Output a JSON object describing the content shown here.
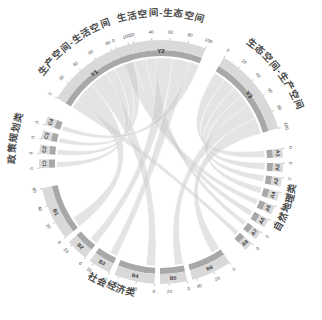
{
  "figure": {
    "type": "chord-diagram",
    "background": "#ffffff",
    "ribbon_color": "#c9c9c9",
    "arc_outer_color": "#d9d9d9",
    "arc_inner_color": "#a8a8a8"
  },
  "groups": [
    {
      "id": "Y1",
      "label": "生产空间-生活空间",
      "axis_label": "Y1",
      "position": "top-left",
      "ticks": [
        0,
        20,
        40,
        60,
        80,
        100
      ],
      "total": 100
    },
    {
      "id": "Y2",
      "label": "生活空间-生态空间",
      "axis_label": "Y2",
      "position": "top-center",
      "ticks": [
        0,
        20,
        40,
        60,
        80,
        100
      ],
      "total": 100
    },
    {
      "id": "Y3",
      "label": "生态空间-生产空间",
      "axis_label": "Y3",
      "position": "top-right",
      "ticks": [
        0,
        20,
        40,
        60,
        80,
        100
      ],
      "total": 100
    },
    {
      "id": "A",
      "label": "自然地理类",
      "position": "right",
      "segments": [
        {
          "id": "A1",
          "ticks": [
            0
          ],
          "value": 10
        },
        {
          "id": "A2",
          "ticks": [
            0
          ],
          "value": 10
        },
        {
          "id": "A3",
          "ticks": [
            0
          ],
          "value": 10
        },
        {
          "id": "A4",
          "ticks": [
            0
          ],
          "value": 10
        },
        {
          "id": "A5",
          "ticks": [
            0
          ],
          "value": 10
        },
        {
          "id": "A6",
          "ticks": [
            0
          ],
          "value": 10
        },
        {
          "id": "A7",
          "ticks": [
            0
          ],
          "value": 10
        },
        {
          "id": "A8",
          "ticks": [
            0
          ],
          "value": 10
        }
      ]
    },
    {
      "id": "C",
      "label": "政策规划类",
      "position": "left",
      "segments": [
        {
          "id": "C1",
          "ticks": [
            0
          ],
          "value": 10
        },
        {
          "id": "C2",
          "ticks": [
            0
          ],
          "value": 10
        },
        {
          "id": "C3",
          "ticks": [
            0
          ],
          "value": 10
        },
        {
          "id": "C4",
          "ticks": [
            0
          ],
          "value": 10
        }
      ]
    },
    {
      "id": "B",
      "label": "社会经济类",
      "position": "bottom",
      "segments": [
        {
          "id": "B1",
          "ticks": [
            0,
            20,
            40,
            60
          ],
          "value": 60
        },
        {
          "id": "B2",
          "ticks": [
            0,
            20
          ],
          "value": 25
        },
        {
          "id": "B3",
          "ticks": [
            0,
            20
          ],
          "value": 25
        },
        {
          "id": "B4",
          "ticks": [
            0,
            20,
            40
          ],
          "value": 45
        },
        {
          "id": "B5",
          "ticks": [
            0,
            20
          ],
          "value": 30
        },
        {
          "id": "B6",
          "ticks": [
            0,
            20,
            40
          ],
          "value": 45
        }
      ]
    }
  ],
  "chart_data": {
    "type": "chord",
    "title": "",
    "legend": "none",
    "grid": false,
    "sources": [
      "A1",
      "A2",
      "A3",
      "A4",
      "A5",
      "A6",
      "A7",
      "A8",
      "B1",
      "B2",
      "B3",
      "B4",
      "B5",
      "B6",
      "C1",
      "C2",
      "C3",
      "C4"
    ],
    "targets": [
      "Y1",
      "Y2",
      "Y3"
    ],
    "source_groups": {
      "自然地理类": [
        "A1",
        "A2",
        "A3",
        "A4",
        "A5",
        "A6",
        "A7",
        "A8"
      ],
      "社会经济类": [
        "B1",
        "B2",
        "B3",
        "B4",
        "B5",
        "B6"
      ],
      "政策规划类": [
        "C1",
        "C2",
        "C3",
        "C4"
      ]
    },
    "target_labels": {
      "Y1": "生产空间-生活空间",
      "Y2": "生活空间-生态空间",
      "Y3": "生态空间-生产空间"
    },
    "axis_range": [
      0,
      100
    ],
    "links": [
      {
        "source": "A1",
        "target": "Y3",
        "value": 9
      },
      {
        "source": "A2",
        "target": "Y3",
        "value": 9
      },
      {
        "source": "A3",
        "target": "Y3",
        "value": 8
      },
      {
        "source": "A4",
        "target": "Y3",
        "value": 8
      },
      {
        "source": "A5",
        "target": "Y2",
        "value": 7
      },
      {
        "source": "A6",
        "target": "Y2",
        "value": 7
      },
      {
        "source": "A7",
        "target": "Y2",
        "value": 6
      },
      {
        "source": "A8",
        "target": "Y1",
        "value": 6
      },
      {
        "source": "B1",
        "target": "Y1",
        "value": 14
      },
      {
        "source": "B2",
        "target": "Y2",
        "value": 10
      },
      {
        "source": "B3",
        "target": "Y2",
        "value": 10
      },
      {
        "source": "B4",
        "target": "Y1",
        "value": 12
      },
      {
        "source": "B5",
        "target": "Y3",
        "value": 11
      },
      {
        "source": "B6",
        "target": "Y3",
        "value": 12
      },
      {
        "source": "C1",
        "target": "Y1",
        "value": 7
      },
      {
        "source": "C2",
        "target": "Y1",
        "value": 7
      },
      {
        "source": "C3",
        "target": "Y1",
        "value": 6
      },
      {
        "source": "C4",
        "target": "Y2",
        "value": 6
      }
    ]
  }
}
